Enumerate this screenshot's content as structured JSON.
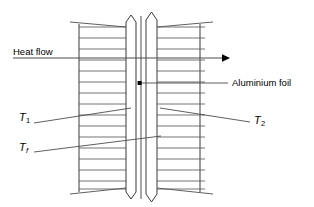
{
  "diagram": {
    "background_color": "#ffffff",
    "line_color": "#000000",
    "hatch_color": "#555555",
    "labels": {
      "heat_flow": "Heat flow",
      "aluminium_foil": "Aluminium foil",
      "t1": "T",
      "t1_sub": "1",
      "t2": "T",
      "t2_sub": "2",
      "tf": "T",
      "tf_sub": "f"
    },
    "annotations": {
      "heat_flow_direction": "left-to-right",
      "foil_marker": "dot",
      "hatch_line_count": 15
    }
  }
}
